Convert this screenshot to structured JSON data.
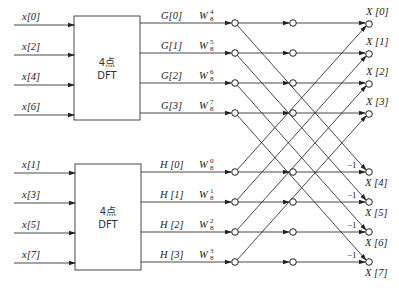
{
  "colors": {
    "line": "#333333",
    "background": "#ffffff",
    "text": "#222222"
  },
  "blocks": [
    {
      "label_line1": "4点",
      "label_line2": "DFT",
      "inputs": [
        "x[0]",
        "x[2]",
        "x[4]",
        "x[6]"
      ],
      "outputs": [
        "G[0]",
        "G[1]",
        "G[2]",
        "G[3]"
      ]
    },
    {
      "label_line1": "4点",
      "label_line2": "DFT",
      "inputs": [
        "x[1]",
        "x[3]",
        "x[5]",
        "x[7]"
      ],
      "outputs": [
        "H [0]",
        "H [1]",
        "H [2]",
        "H [3]"
      ]
    }
  ],
  "twiddles": {
    "top": [
      {
        "base": "W",
        "sub": "8",
        "sup": "4"
      },
      {
        "base": "W",
        "sub": "8",
        "sup": "5"
      },
      {
        "base": "W",
        "sub": "8",
        "sup": "6"
      },
      {
        "base": "W",
        "sub": "8",
        "sup": "7"
      }
    ],
    "bottom": [
      {
        "base": "W",
        "sub": "8",
        "sup": "0"
      },
      {
        "base": "W",
        "sub": "8",
        "sup": "1"
      },
      {
        "base": "W",
        "sub": "8",
        "sup": "2"
      },
      {
        "base": "W",
        "sub": "8",
        "sup": "3"
      }
    ]
  },
  "outputs": {
    "top": [
      "X [0]",
      "X [1]",
      "X [2]",
      "X [3]"
    ],
    "bottom": [
      "X [4]",
      "X [5]",
      "X [6]",
      "X [7]"
    ]
  },
  "negation_labels": [
    "−1",
    "−1",
    "−1",
    "−1"
  ]
}
